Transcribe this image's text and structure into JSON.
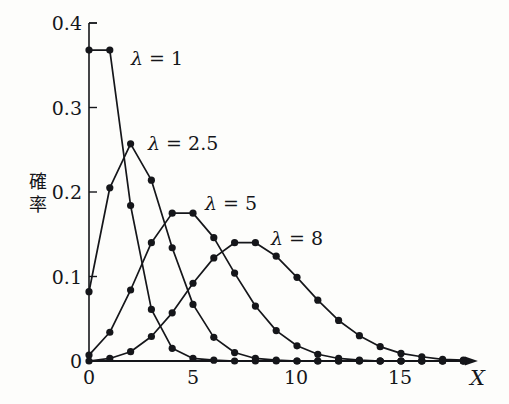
{
  "figure": {
    "background_color": "#fdfdfb",
    "ink_color": "#15161a",
    "x_axis_name": "X",
    "y_axis_name": "確率",
    "y_axis_name_chars": [
      "確",
      "率"
    ]
  },
  "axes": {
    "x_ticks": [
      {
        "value": 0,
        "label": "0"
      },
      {
        "value": 5,
        "label": "5"
      },
      {
        "value": 10,
        "label": "10"
      },
      {
        "value": 15,
        "label": "15"
      }
    ],
    "y_ticks": [
      {
        "value": 0,
        "label": "0"
      },
      {
        "value": 0.1,
        "label": "0.1"
      },
      {
        "value": 0.2,
        "label": "0.2"
      },
      {
        "value": 0.3,
        "label": "0.3"
      },
      {
        "value": 0.4,
        "label": "0.4"
      }
    ]
  },
  "series_labels": {
    "l1": {
      "text": "λ = 1",
      "lambda": "λ",
      "eq": "=",
      "value": "1"
    },
    "l2": {
      "text": "λ = 2.5",
      "lambda": "λ",
      "eq": "=",
      "value": "2.5"
    },
    "l3": {
      "text": "λ = 5",
      "lambda": "λ",
      "eq": "=",
      "value": "5"
    },
    "l4": {
      "text": "λ = 8",
      "lambda": "λ",
      "eq": "=",
      "value": "8"
    }
  },
  "chart_data": {
    "type": "line",
    "title": "",
    "subtitle": "",
    "xlabel": "X",
    "ylabel": "確率",
    "xlim": [
      0,
      18.6
    ],
    "ylim": [
      0,
      0.4
    ],
    "grid": false,
    "legend": "inline-annotations",
    "markers": "filled-circle",
    "x": [
      0,
      1,
      2,
      3,
      4,
      5,
      6,
      7,
      8,
      9,
      10,
      11,
      12,
      13,
      14,
      15,
      16,
      17,
      18
    ],
    "series": [
      {
        "name": "λ = 1",
        "lambda": 1,
        "values": [
          0.368,
          0.368,
          0.184,
          0.061,
          0.015,
          0.003,
          0.001,
          0.0,
          0.0,
          0.0,
          0.0,
          0.0,
          0.0,
          0.0,
          0.0,
          0.0,
          0.0,
          0.0,
          0.0
        ]
      },
      {
        "name": "λ = 2.5",
        "lambda": 2.5,
        "values": [
          0.082,
          0.205,
          0.257,
          0.214,
          0.134,
          0.067,
          0.028,
          0.01,
          0.003,
          0.001,
          0.0,
          0.0,
          0.0,
          0.0,
          0.0,
          0.0,
          0.0,
          0.0,
          0.0
        ]
      },
      {
        "name": "λ = 5",
        "lambda": 5,
        "values": [
          0.007,
          0.034,
          0.084,
          0.14,
          0.175,
          0.175,
          0.146,
          0.104,
          0.065,
          0.036,
          0.018,
          0.008,
          0.003,
          0.001,
          0.0,
          0.0,
          0.0,
          0.0,
          0.0
        ]
      },
      {
        "name": "λ = 8",
        "lambda": 8,
        "values": [
          0.0,
          0.003,
          0.011,
          0.029,
          0.057,
          0.092,
          0.122,
          0.14,
          0.14,
          0.124,
          0.099,
          0.072,
          0.048,
          0.03,
          0.017,
          0.009,
          0.005,
          0.002,
          0.001
        ]
      }
    ]
  }
}
